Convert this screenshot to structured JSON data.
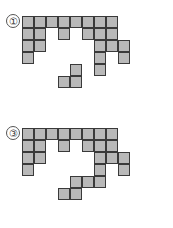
{
  "page": {
    "background_color": "#ffffff",
    "width": 173,
    "height": 228
  },
  "style": {
    "cell_size": 12,
    "cell_fill_color": "#b9b9b9",
    "cell_border_color": "#3a3a3a",
    "label_text_color": "#333333",
    "label_border_color": "#555555"
  },
  "figures": [
    {
      "id": "figure-1",
      "label": "①",
      "label_number": "1",
      "label_x": 6,
      "label_y": 14,
      "origin_x": 22,
      "origin_y": 16,
      "cols": 10,
      "rows": 7,
      "cell_count": 26,
      "cells": [
        [
          0,
          0
        ],
        [
          1,
          0
        ],
        [
          2,
          0
        ],
        [
          3,
          0
        ],
        [
          4,
          0
        ],
        [
          5,
          0
        ],
        [
          6,
          0
        ],
        [
          7,
          0
        ],
        [
          0,
          1
        ],
        [
          1,
          1
        ],
        [
          3,
          1
        ],
        [
          5,
          1
        ],
        [
          6,
          1
        ],
        [
          7,
          1
        ],
        [
          0,
          2
        ],
        [
          1,
          2
        ],
        [
          6,
          2
        ],
        [
          7,
          2
        ],
        [
          8,
          2
        ],
        [
          0,
          3
        ],
        [
          6,
          3
        ],
        [
          8,
          3
        ],
        [
          4,
          4
        ],
        [
          6,
          4
        ],
        [
          3,
          5
        ],
        [
          4,
          5
        ]
      ]
    },
    {
      "id": "figure-3",
      "label": "③",
      "label_number": "3",
      "label_x": 6,
      "label_y": 126,
      "origin_x": 22,
      "origin_y": 128,
      "cols": 10,
      "rows": 7,
      "cell_count": 26,
      "cells": [
        [
          0,
          0
        ],
        [
          1,
          0
        ],
        [
          2,
          0
        ],
        [
          3,
          0
        ],
        [
          4,
          0
        ],
        [
          5,
          0
        ],
        [
          6,
          0
        ],
        [
          7,
          0
        ],
        [
          0,
          1
        ],
        [
          1,
          1
        ],
        [
          3,
          1
        ],
        [
          5,
          1
        ],
        [
          6,
          1
        ],
        [
          7,
          1
        ],
        [
          0,
          2
        ],
        [
          1,
          2
        ],
        [
          6,
          2
        ],
        [
          7,
          2
        ],
        [
          8,
          2
        ],
        [
          0,
          3
        ],
        [
          6,
          3
        ],
        [
          8,
          3
        ],
        [
          4,
          4
        ],
        [
          5,
          4
        ],
        [
          6,
          4
        ],
        [
          3,
          5
        ],
        [
          4,
          5
        ]
      ]
    }
  ]
}
